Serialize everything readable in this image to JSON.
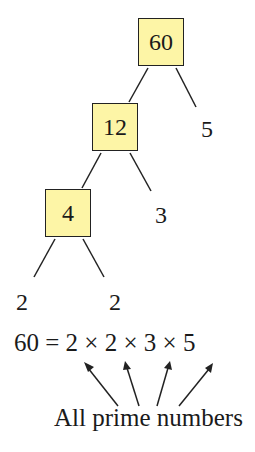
{
  "diagram": {
    "type": "factor-tree",
    "colors": {
      "box_fill": "#fdf5a6",
      "box_border": "#222222",
      "line": "#222222"
    },
    "nodes": {
      "root": {
        "value": "60",
        "composite": true
      },
      "n12": {
        "value": "12",
        "composite": true
      },
      "n4": {
        "value": "4",
        "composite": true
      },
      "leaf5": {
        "value": "5",
        "prime": true
      },
      "leaf3": {
        "value": "3",
        "prime": true
      },
      "leaf2a": {
        "value": "2",
        "prime": true
      },
      "leaf2b": {
        "value": "2",
        "prime": true
      }
    },
    "edges": [
      [
        "60",
        "12"
      ],
      [
        "60",
        "5"
      ],
      [
        "12",
        "4"
      ],
      [
        "12",
        "3"
      ],
      [
        "4",
        "2"
      ],
      [
        "4",
        "2"
      ]
    ],
    "equation": "60 = 2 × 2 × 3 × 5",
    "caption": "All prime numbers"
  }
}
